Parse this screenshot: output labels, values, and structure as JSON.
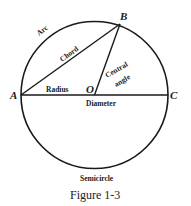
{
  "figure": {
    "caption": "Figure 1-3",
    "points": {
      "A": "A",
      "B": "B",
      "C": "C",
      "O": "O"
    },
    "labels": {
      "arc": "Arc",
      "chord": "Chord",
      "radius": "Radius",
      "central_angle_line1": "Central",
      "central_angle_line2": "angle",
      "diameter": "Diameter",
      "semicircle": "Semicircle"
    },
    "colors": {
      "stroke": "#1a1a1a",
      "background": "#ffffff"
    }
  }
}
